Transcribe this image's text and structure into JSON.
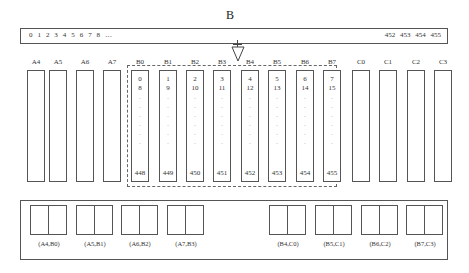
{
  "diagram": {
    "title": "B",
    "top_bar": {
      "left_text": "0 1 2 3 4 5 6 7 8 …",
      "right_text": "452 453 454 455"
    },
    "columns": [
      {
        "label": "A4",
        "x": 27,
        "group": "A"
      },
      {
        "label": "A5",
        "x": 49,
        "group": "A"
      },
      {
        "label": "A6",
        "x": 76,
        "group": "A"
      },
      {
        "label": "A7",
        "x": 103,
        "group": "A"
      },
      {
        "label": "B0",
        "x": 131,
        "group": "B",
        "top1": "0",
        "top2": "8",
        "bottom": "448"
      },
      {
        "label": "B1",
        "x": 159,
        "group": "B",
        "top1": "1",
        "top2": "9",
        "bottom": "449"
      },
      {
        "label": "B2",
        "x": 186,
        "group": "B",
        "top1": "2",
        "top2": "10",
        "bottom": "450"
      },
      {
        "label": "B3",
        "x": 213,
        "group": "B",
        "top1": "3",
        "top2": "11",
        "bottom": "451"
      },
      {
        "label": "B4",
        "x": 241,
        "group": "B",
        "top1": "4",
        "top2": "12",
        "bottom": "452"
      },
      {
        "label": "B5",
        "x": 268,
        "group": "B",
        "top1": "5",
        "top2": "13",
        "bottom": "453"
      },
      {
        "label": "B6",
        "x": 296,
        "group": "B",
        "top1": "6",
        "top2": "14",
        "bottom": "454"
      },
      {
        "label": "B7",
        "x": 323,
        "group": "B",
        "top1": "7",
        "top2": "15",
        "bottom": "455"
      },
      {
        "label": "C0",
        "x": 352,
        "group": "C"
      },
      {
        "label": "C1",
        "x": 379,
        "group": "C"
      },
      {
        "label": "C2",
        "x": 407,
        "group": "C"
      },
      {
        "label": "C3",
        "x": 434,
        "group": "C"
      }
    ],
    "dots": "·\n·\n·\n·\n·\n·",
    "pairs": [
      {
        "label": "(A4,B0)",
        "x": 30
      },
      {
        "label": "(A5,B1)",
        "x": 76
      },
      {
        "label": "(A6,B2)",
        "x": 121
      },
      {
        "label": "(A7,B3)",
        "x": 167
      },
      {
        "label": "(B4,C0)",
        "x": 269
      },
      {
        "label": "(B5,C1)",
        "x": 315
      },
      {
        "label": "(B6,C2)",
        "x": 361
      },
      {
        "label": "(B7,C3)",
        "x": 406
      }
    ]
  }
}
